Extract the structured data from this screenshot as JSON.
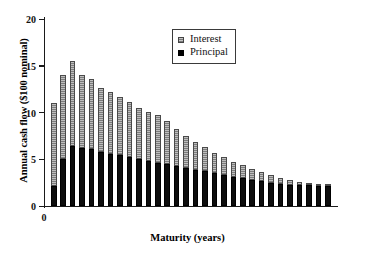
{
  "chart_data": {
    "type": "bar",
    "subtype": "stacked-column",
    "title": "",
    "xlabel": "Maturity (years)",
    "ylabel": "Annual cash flow ($100 nominal)",
    "ylim": [
      0,
      20
    ],
    "yticks": [
      0,
      5,
      10,
      15,
      20
    ],
    "ytick_labels": [
      "0",
      "5",
      "10",
      "15",
      "20"
    ],
    "xticks": [
      0
    ],
    "xtick_labels": [
      "0"
    ],
    "grid": false,
    "legend_position": "top-center-inset",
    "categories": [
      1,
      2,
      3,
      4,
      5,
      6,
      7,
      8,
      9,
      10,
      11,
      12,
      13,
      14,
      15,
      16,
      17,
      18,
      19,
      20,
      21,
      22,
      23,
      24,
      25,
      26,
      27,
      28,
      29,
      30
    ],
    "series": [
      {
        "name": "Principal",
        "color": "#0d0d0d",
        "values": [
          2.1,
          5.0,
          6.4,
          6.25,
          6.05,
          5.75,
          5.6,
          5.45,
          5.2,
          5.0,
          4.8,
          4.65,
          4.45,
          4.25,
          4.1,
          3.9,
          3.75,
          3.5,
          3.3,
          3.1,
          2.95,
          2.8,
          2.65,
          2.5,
          2.4,
          2.3,
          2.25,
          2.2,
          2.15,
          2.1
        ]
      },
      {
        "name": "Interest",
        "color": "#8a8a8a",
        "values": [
          8.9,
          9.0,
          9.1,
          7.75,
          7.5,
          6.85,
          6.6,
          6.25,
          5.9,
          5.5,
          5.3,
          5.05,
          4.65,
          4.0,
          3.4,
          2.95,
          2.6,
          2.15,
          1.9,
          1.65,
          1.4,
          1.2,
          1.0,
          0.85,
          0.6,
          0.45,
          0.3,
          0.2,
          0.15,
          0.1
        ]
      }
    ],
    "totals": [
      11.0,
      14.0,
      15.5,
      14.0,
      13.55,
      12.6,
      12.2,
      11.7,
      11.1,
      10.5,
      10.1,
      9.7,
      9.1,
      8.25,
      7.5,
      6.85,
      6.35,
      5.65,
      5.2,
      4.75,
      4.35,
      4.0,
      3.65,
      3.35,
      3.0,
      2.75,
      2.55,
      2.4,
      2.3,
      2.2
    ]
  },
  "legend": {
    "items": [
      {
        "label": "Interest",
        "swatch": "interest-swatch"
      },
      {
        "label": "Principal",
        "swatch": "principal-swatch"
      }
    ]
  }
}
